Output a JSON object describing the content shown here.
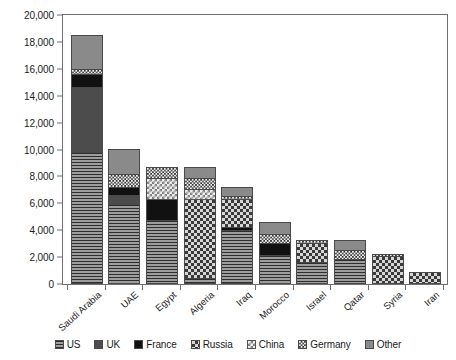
{
  "chart_data": {
    "type": "bar",
    "stacked": true,
    "title": "",
    "xlabel": "",
    "ylabel": "Million US Dollars",
    "ylim": [
      0,
      20000
    ],
    "ytick_step": 2000,
    "ytick_labels": [
      "20,000",
      "18,000",
      "16,000",
      "14,000",
      "12,000",
      "10,000",
      "8,000",
      "6,000",
      "4,000",
      "2,000",
      "0"
    ],
    "ytick_values": [
      20000,
      18000,
      16000,
      14000,
      12000,
      10000,
      8000,
      6000,
      4000,
      2000,
      0
    ],
    "grid": false,
    "legend_position": "bottom",
    "categories": [
      "Saudi Arabia",
      "UAE",
      "Egypt",
      "Algeria",
      "Iraq",
      "Morocco",
      "Israel",
      "Qatar",
      "Syria",
      "Iran"
    ],
    "series": [
      {
        "name": "US",
        "pattern": "horizontal-lines",
        "color": "#9d9d9d",
        "values": [
          9700,
          5800,
          4600,
          300,
          3900,
          2000,
          1500,
          1700,
          0,
          0
        ]
      },
      {
        "name": "UK",
        "pattern": "dark-solid",
        "color": "#4c4c4c",
        "values": [
          4700,
          600,
          0,
          0,
          0,
          0,
          0,
          0,
          0,
          0
        ]
      },
      {
        "name": "France",
        "pattern": "black-solid",
        "color": "#111111",
        "values": [
          900,
          500,
          1500,
          0,
          150,
          850,
          0,
          0,
          0,
          0
        ]
      },
      {
        "name": "Russia",
        "pattern": "dark-checkerboard",
        "color": "#3a3a3a",
        "values": [
          0,
          0,
          0,
          5800,
          2000,
          0,
          1300,
          0,
          1950,
          750
        ]
      },
      {
        "name": "China",
        "pattern": "light-checkerboard",
        "color": "#ededed",
        "values": [
          0,
          0,
          1500,
          650,
          0,
          0,
          0,
          0,
          0,
          0
        ]
      },
      {
        "name": "Germany",
        "pattern": "fine-checker",
        "color": "#f2f2f2",
        "values": [
          350,
          900,
          700,
          750,
          150,
          600,
          200,
          600,
          50,
          0
        ]
      },
      {
        "name": "Other",
        "pattern": "mid-grey-solid",
        "color": "#8a8a8a",
        "values": [
          2450,
          1800,
          0,
          750,
          550,
          800,
          0,
          700,
          0,
          0
        ]
      }
    ],
    "totals": [
      18100,
      9600,
      8300,
      8250,
      6750,
      4250,
      3000,
      3000,
      2000,
      750
    ]
  },
  "legend": {
    "items": [
      {
        "label": "US"
      },
      {
        "label": "UK"
      },
      {
        "label": "France"
      },
      {
        "label": "Russia"
      },
      {
        "label": "China"
      },
      {
        "label": "Germany"
      },
      {
        "label": "Other"
      }
    ]
  }
}
